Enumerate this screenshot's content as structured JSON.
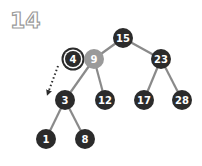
{
  "step_number": "14",
  "colors": {
    "node_fill": "#2b2b2b",
    "node_highlight_fill": "#9a9a9a",
    "edge": "#8a8a8a",
    "label": "#ffffff",
    "arrow": "#2b2b2b"
  },
  "nodes": [
    {
      "id": "n15",
      "label": "15",
      "x": 123,
      "y": 38,
      "style": "normal"
    },
    {
      "id": "n4",
      "label": "4",
      "x": 73,
      "y": 59,
      "style": "selected"
    },
    {
      "id": "n9",
      "label": "9",
      "x": 94,
      "y": 59,
      "style": "gray"
    },
    {
      "id": "n23",
      "label": "23",
      "x": 161,
      "y": 59,
      "style": "normal"
    },
    {
      "id": "n3",
      "label": "3",
      "x": 65,
      "y": 100,
      "style": "normal"
    },
    {
      "id": "n12",
      "label": "12",
      "x": 105,
      "y": 100,
      "style": "normal"
    },
    {
      "id": "n17",
      "label": "17",
      "x": 144,
      "y": 100,
      "style": "normal"
    },
    {
      "id": "n28",
      "label": "28",
      "x": 182,
      "y": 100,
      "style": "normal"
    },
    {
      "id": "n1",
      "label": "1",
      "x": 46,
      "y": 139,
      "style": "normal"
    },
    {
      "id": "n8",
      "label": "8",
      "x": 85,
      "y": 139,
      "style": "normal"
    }
  ],
  "edges": [
    [
      "n15",
      "n9"
    ],
    [
      "n15",
      "n23"
    ],
    [
      "n9",
      "n3"
    ],
    [
      "n9",
      "n12"
    ],
    [
      "n23",
      "n17"
    ],
    [
      "n23",
      "n28"
    ],
    [
      "n3",
      "n1"
    ],
    [
      "n3",
      "n8"
    ]
  ],
  "arrow": {
    "from": [
      58,
      66
    ],
    "to": [
      48,
      93
    ],
    "style": "dotted"
  }
}
